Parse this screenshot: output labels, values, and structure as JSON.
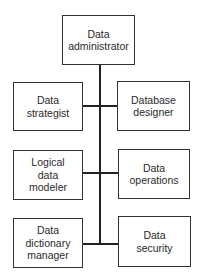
{
  "diagram": {
    "type": "org-chart",
    "root": {
      "label": "Data\nadministrator"
    },
    "rows": [
      {
        "left": {
          "label": "Data\nstrategist"
        },
        "right": {
          "label": "Database\ndesigner"
        }
      },
      {
        "left": {
          "label": "Logical\ndata\nmodeler"
        },
        "right": {
          "label": "Data\noperations"
        }
      },
      {
        "left": {
          "label": "Data\ndictionary\nmanager"
        },
        "right": {
          "label": "Data\nsecurity"
        }
      }
    ],
    "colors": {
      "line": "#222222",
      "box_border": "#333333",
      "background": "#ffffff"
    }
  }
}
